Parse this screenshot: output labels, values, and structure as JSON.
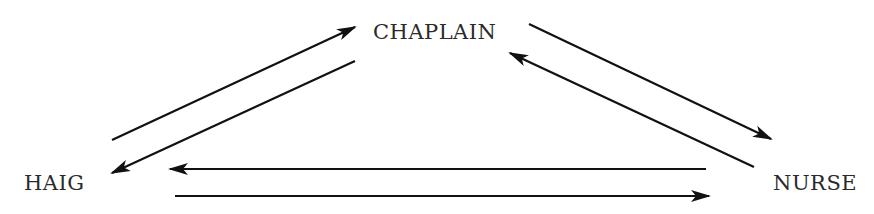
{
  "diagram": {
    "type": "relationship-triangle",
    "nodes": [
      {
        "id": "chaplain",
        "label": "CHAPLAIN"
      },
      {
        "id": "haig",
        "label": "HAIG"
      },
      {
        "id": "nurse",
        "label": "NURSE"
      }
    ],
    "edges": [
      {
        "from": "haig",
        "to": "chaplain"
      },
      {
        "from": "chaplain",
        "to": "haig"
      },
      {
        "from": "chaplain",
        "to": "nurse"
      },
      {
        "from": "nurse",
        "to": "chaplain"
      },
      {
        "from": "nurse",
        "to": "haig"
      },
      {
        "from": "haig",
        "to": "nurse"
      }
    ],
    "colors": {
      "line": "#111111",
      "text": "#2a2a2a",
      "background": "#ffffff"
    }
  }
}
